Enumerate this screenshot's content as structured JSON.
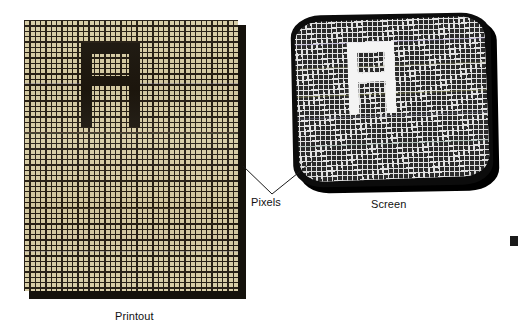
{
  "figure": {
    "title_implied": "Pixels on a printout versus pixels on a screen",
    "labels": {
      "pixels": "Pixels",
      "screen": "Screen",
      "printout": "Printout"
    },
    "colors": {
      "paper_background": "#d6cca4",
      "paper_grid_line": "#20190f",
      "paper_glyph": "#17120a",
      "paper_shadow": "#15120c",
      "screen_background": "#2b2b2b",
      "screen_grid_line": "#e2e2e2",
      "screen_glyph": "#f4f4f4",
      "screen_bezel": "#0c0c0c",
      "label_text": "#111111",
      "leader_line": "#1a1a1a",
      "page_background": "#ffffff"
    }
  },
  "printout": {
    "name": "Printout",
    "media": "paper",
    "grid": {
      "cell_size_px": 5.35,
      "line_width_px": 1.3,
      "columns": 40,
      "rows": 51,
      "line_color": "#20190f",
      "cell_color": "#d6cca4"
    },
    "glyph": {
      "character": "A",
      "style": "blocky-pixel",
      "color": "#17120a",
      "segments": [
        {
          "name": "top-bar",
          "left": 57,
          "top": 23,
          "width": 59,
          "height": 11
        },
        {
          "name": "left-stem",
          "left": 57,
          "top": 23,
          "width": 11,
          "height": 84
        },
        {
          "name": "right-stem",
          "left": 105,
          "top": 23,
          "width": 11,
          "height": 84
        },
        {
          "name": "middle-bar",
          "left": 57,
          "top": 56,
          "width": 59,
          "height": 10
        }
      ]
    },
    "scan_lines": [
      {
        "top": 63,
        "color": "#6a6a9e"
      },
      {
        "top": 112,
        "color": "#8d6a52"
      },
      {
        "top": 113,
        "color": "#5f7a52"
      },
      {
        "top": 188,
        "color": "#7b6f52"
      },
      {
        "top": 231,
        "color": "#6f6a84"
      }
    ]
  },
  "screen": {
    "name": "Screen",
    "media": "crt-display",
    "grid": {
      "cell_size_px": 5.1,
      "line_width_px": 1.25,
      "columns": 39,
      "rows": 33,
      "line_color": "#e2e2e2",
      "cell_color": "#2b2b2b"
    },
    "glyph": {
      "character": "A",
      "style": "blocky-pixel",
      "color": "#f4f4f4",
      "segments": [
        {
          "name": "top-bar",
          "left": 52,
          "top": 22,
          "width": 47,
          "height": 10
        },
        {
          "name": "left-stem",
          "left": 52,
          "top": 22,
          "width": 10,
          "height": 72
        },
        {
          "name": "right-stem",
          "left": 89,
          "top": 22,
          "width": 10,
          "height": 72
        },
        {
          "name": "middle-bar",
          "left": 52,
          "top": 53,
          "width": 47,
          "height": 9
        }
      ]
    },
    "scan_lines": [
      {
        "top": 22,
        "color": "#8f7fbf"
      },
      {
        "top": 46,
        "color": "#9a9a6a"
      },
      {
        "top": 74,
        "color": "#b5b56a"
      },
      {
        "top": 96,
        "color": "#7f7f9a"
      },
      {
        "top": 124,
        "color": "#6a8f7f"
      }
    ]
  },
  "annotations": {
    "pixels_callout": {
      "label": "Pixels",
      "apex": {
        "x": 272,
        "y": 194
      },
      "targets": [
        {
          "name": "printout-pixels",
          "x": 243,
          "y": 166
        },
        {
          "name": "screen-pixels",
          "x": 313,
          "y": 161
        }
      ]
    }
  }
}
